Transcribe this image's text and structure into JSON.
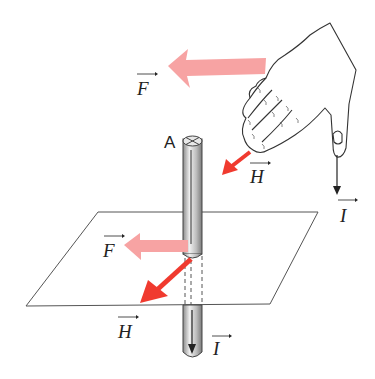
{
  "diagram": {
    "type": "physics-right-hand-rule",
    "labels": {
      "force_top": "F",
      "field_top": "H",
      "current_top": "I",
      "wire_point": "A",
      "force_plane": "F",
      "field_plane": "H",
      "current_bottom": "I"
    },
    "colors": {
      "force_arrow": "#f7a3a3",
      "field_arrow": "#f03a2f",
      "line": "#333333",
      "rod_light": "#e6e6e6",
      "rod_dark": "#8a8a8a"
    }
  }
}
